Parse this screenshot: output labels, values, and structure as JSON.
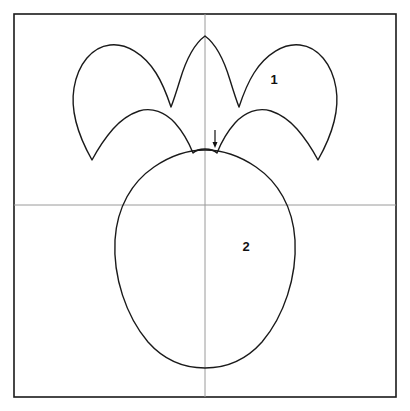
{
  "figure": {
    "background_color": "#ffffff",
    "canvas": {
      "width": 410,
      "height": 411
    }
  },
  "frame": {
    "name": "pattern-frame",
    "stroke_color": "#1a1a1a",
    "stroke_width": 1.6,
    "x": 14,
    "y": 14,
    "width": 382,
    "height": 383
  },
  "guides": {
    "stroke_color": "#9a9a9a",
    "stroke_width": 1,
    "vertical": {
      "name": "vertical-center-guide",
      "x": 205,
      "y1": 14,
      "y2": 397
    },
    "horizontal": {
      "name": "horizontal-center-guide",
      "y": 205,
      "x1": 14,
      "x2": 396
    }
  },
  "shapes": {
    "stroke_color": "#1a1a1a",
    "fill": "none",
    "stroke_width": 1.4,
    "crown": {
      "name": "crown-piece-outline",
      "label": "1",
      "label_x": 274,
      "label_y": 84,
      "path": "M 205 36 C 194 44 186 60 180 80 C 176 93 173 102 171 107 C 168 98 163 84 156 73 C 144 54 126 43 110 45 C 92 47 78 64 74 88 C 70 112 79 137 92 160 C 99 147 106 137 113 129 C 121 120 130 114 139 111 C 152 107 165 112 175 123 C 183 132 189 143 193 153 C 196 150 200 149 205 149 C 210 149 214 150 217 153 C 221 143 227 132 235 123 C 245 112 258 107 271 111 C 280 114 289 120 297 129 C 304 137 311 147 318 160 C 331 137 340 112 336 88 C 332 64 318 47 300 45 C 284 43 266 54 254 73 C 247 84 242 98 239 107 C 237 102 234 93 230 80 C 224 60 216 44 205 36 Z"
    },
    "body": {
      "name": "body-piece-outline",
      "label": "2",
      "label_x": 246,
      "label_y": 251,
      "path": "M 205 150 C 188 150 170 156 154 167 C 132 182 117 207 115 240 C 113 277 126 316 148 342 C 164 360 184 368 205 368 C 226 368 246 360 262 342 C 284 316 297 277 295 240 C 293 207 278 182 256 167 C 240 156 222 150 205 150 Z"
    }
  },
  "arrow": {
    "name": "placement-arrow",
    "direction": "down",
    "stroke_color": "#111111",
    "stroke_width": 1.2,
    "x": 215,
    "y_start": 130,
    "y_end": 148,
    "head_width": 5,
    "head_length": 6
  },
  "labels": [
    {
      "name": "piece-number-1",
      "text": "1"
    },
    {
      "name": "piece-number-2",
      "text": "2"
    }
  ]
}
